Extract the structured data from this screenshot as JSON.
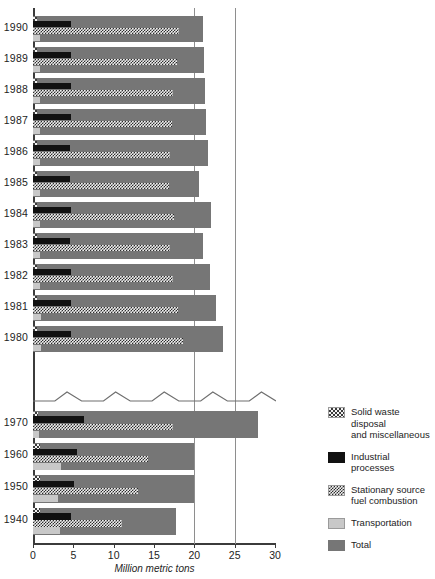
{
  "chart_data": {
    "type": "bar",
    "orientation": "horizontal",
    "title": "",
    "xlabel": "Million metric tons",
    "ylabel": "",
    "xlim": [
      0,
      30
    ],
    "xticks": [
      0,
      5,
      10,
      15,
      20,
      25,
      30
    ],
    "xtick_labels": [
      "0",
      "5",
      "10",
      "15",
      "20",
      "25",
      "30"
    ],
    "grid": true,
    "gridlines_at": [
      20,
      25
    ],
    "axis_break": {
      "present": true,
      "between": [
        "1980",
        "1970"
      ],
      "style": "zigzag"
    },
    "legend_position": "right",
    "categories": [
      "1990",
      "1989",
      "1988",
      "1987",
      "1986",
      "1985",
      "1984",
      "1983",
      "1982",
      "1981",
      "1980",
      "1970",
      "1960",
      "1950",
      "1940"
    ],
    "series": [
      {
        "name": "Solid waste disposal and miscellaneous",
        "color": "#f2f2f2",
        "pattern": "sparse-checker",
        "values": [
          0.5,
          0.5,
          0.5,
          0.5,
          0.5,
          0.5,
          0.5,
          0.5,
          0.5,
          0.5,
          0.5,
          0.6,
          0.9,
          0.9,
          0.9
        ]
      },
      {
        "name": "Industrial processes",
        "color": "#111111",
        "pattern": "solid",
        "values": [
          4.7,
          4.7,
          4.7,
          4.7,
          4.6,
          4.6,
          4.7,
          4.6,
          4.7,
          4.7,
          4.7,
          6.3,
          5.5,
          5.1,
          4.7
        ]
      },
      {
        "name": "Stationary source fuel combustion",
        "color": "#2b2b2b",
        "pattern": "dense-checker",
        "values": [
          18.1,
          17.8,
          17.4,
          17.2,
          17.0,
          16.8,
          17.5,
          17.0,
          17.3,
          18.0,
          18.6,
          17.3,
          14.2,
          13.0,
          11.0
        ]
      },
      {
        "name": "Transportation",
        "color": "#c8c8c8",
        "pattern": "solid",
        "values": [
          0.9,
          0.9,
          0.9,
          0.9,
          0.9,
          0.9,
          0.9,
          0.9,
          0.9,
          1.0,
          1.0,
          0.7,
          3.5,
          3.1,
          3.4
        ]
      },
      {
        "name": "Total",
        "color": "#767676",
        "pattern": "solid",
        "values": [
          21.1,
          21.2,
          21.3,
          21.4,
          21.7,
          20.6,
          22.1,
          21.1,
          21.9,
          22.7,
          23.6,
          27.9,
          19.9,
          19.9,
          17.7
        ]
      }
    ]
  },
  "axis": {
    "x_title": "Million metric tons",
    "tick_labels": [
      "0",
      "5",
      "10",
      "15",
      "20",
      "25",
      "30"
    ],
    "year_labels": [
      "1990",
      "1989",
      "1988",
      "1987",
      "1986",
      "1985",
      "1984",
      "1983",
      "1982",
      "1981",
      "1980",
      "1970",
      "1960",
      "1950",
      "1940"
    ]
  },
  "legend": {
    "items": [
      {
        "label": "Solid waste disposal\nand miscellaneous",
        "line1": "Solid waste disposal",
        "line2": "and miscellaneous",
        "swatch": "solidwaste"
      },
      {
        "label": "Industrial processes",
        "line1": "Industrial processes",
        "line2": "",
        "swatch": "industrial"
      },
      {
        "label": "Stationary source\nfuel combustion",
        "line1": "Stationary source",
        "line2": "fuel combustion",
        "swatch": "stationary"
      },
      {
        "label": "Transportation",
        "line1": "Transportation",
        "line2": "",
        "swatch": "transport"
      },
      {
        "label": "Total",
        "line1": "Total",
        "line2": "",
        "swatch": "total"
      }
    ]
  },
  "colors": {
    "total": "#767676",
    "industrial": "#111111",
    "transportation": "#c8c8c8",
    "stationary": "#2b2b2b",
    "solid_waste": "#3a3a3a",
    "axis": "#3b3b3b",
    "gridline": "#8e8e8e"
  }
}
